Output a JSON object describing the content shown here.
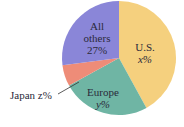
{
  "chart_data": {
    "type": "pie",
    "title": "",
    "slices": [
      {
        "label": "U.S.",
        "value_label": "x%",
        "value": 42,
        "color": "#f5d07e"
      },
      {
        "label": "Europe",
        "value_label": "y%",
        "value": 25,
        "color": "#6fb5a4"
      },
      {
        "label": "Japan",
        "value_label": "z%",
        "value": 6,
        "color": "#ee8c78"
      },
      {
        "label": "All others",
        "value_label": "27%",
        "value": 27,
        "color": "#8a86d8"
      }
    ]
  },
  "labels": {
    "us_name": "U.S.",
    "us_value": "x%",
    "europe_name": "Europe",
    "europe_value": "y%",
    "japan": "Japan z%",
    "others_line1": "All",
    "others_line2": "others",
    "others_value": "27%"
  }
}
